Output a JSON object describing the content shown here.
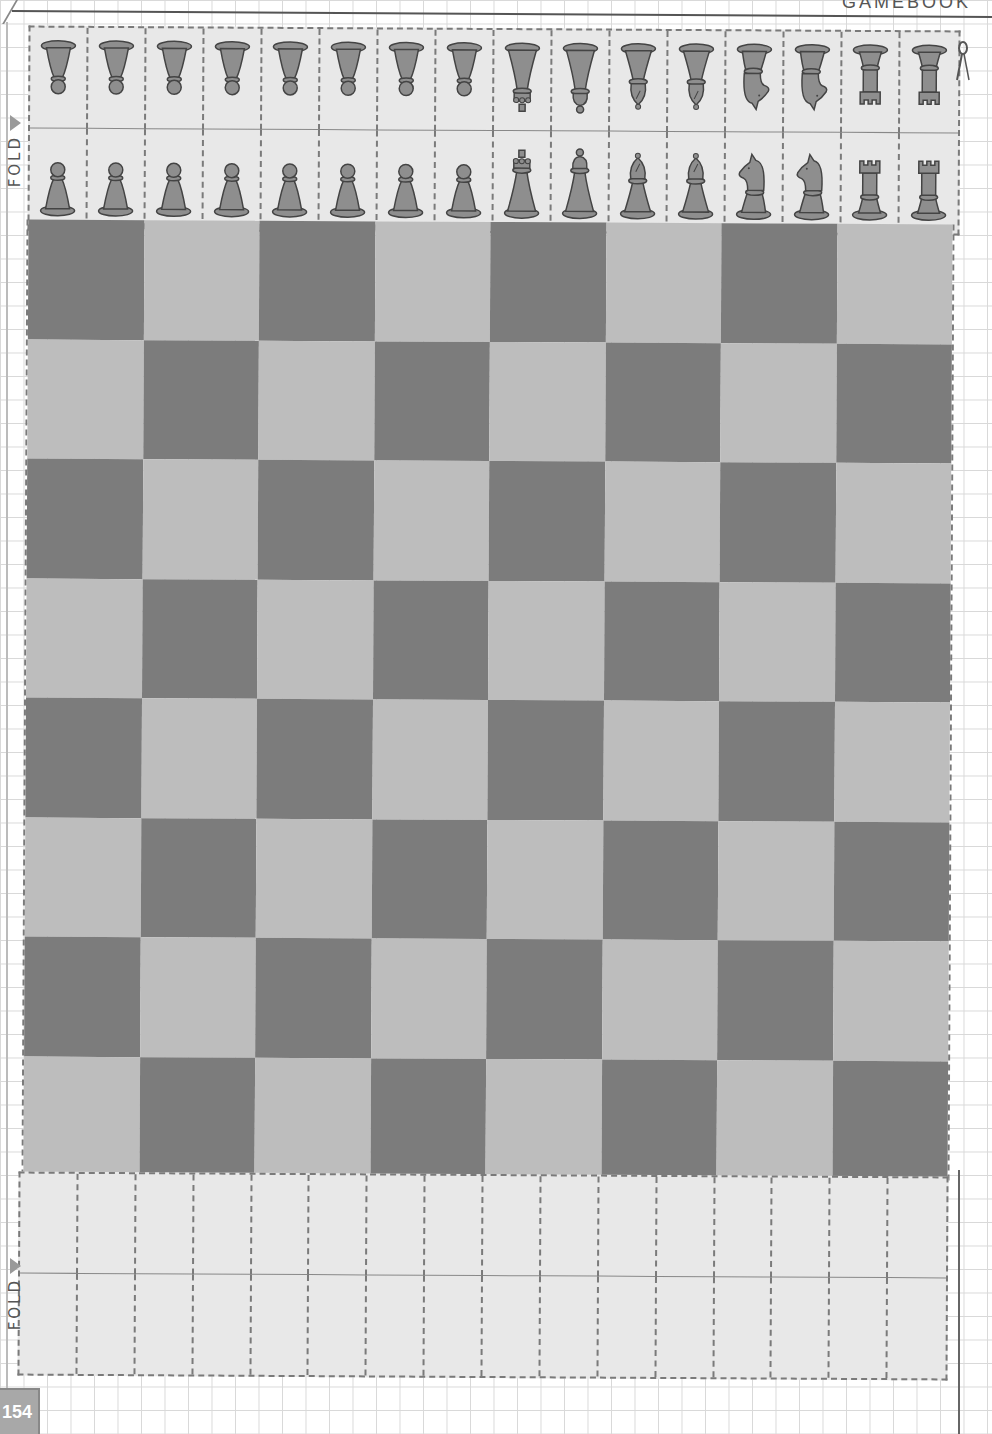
{
  "page": {
    "header_text_partial": "GAMEBOOK",
    "page_number": "154"
  },
  "fold_labels": {
    "top": "FOLD",
    "bottom": "FOLD"
  },
  "cut_marker": {
    "icon": "scissors-icon"
  },
  "colors": {
    "dark_square": "#7c7c7c",
    "light_square": "#bdbdbd",
    "strip_bg": "#e8e8e8",
    "piece_fill": "#8e8e8e",
    "piece_stroke": "#444444",
    "dash": "#7a7a7a"
  },
  "board": {
    "rows": 8,
    "cols": 8,
    "top_left": "dark"
  },
  "top_strip": {
    "pieces": [
      "pawn",
      "pawn",
      "pawn",
      "pawn",
      "pawn",
      "pawn",
      "pawn",
      "pawn",
      "king",
      "queen",
      "bishop",
      "bishop",
      "knight",
      "knight",
      "rook",
      "rook"
    ]
  },
  "bottom_strip": {
    "pieces": [
      "",
      "",
      "",
      "",
      "",
      "",
      "",
      "",
      "",
      "",
      "",
      "",
      "",
      "",
      "",
      ""
    ]
  }
}
